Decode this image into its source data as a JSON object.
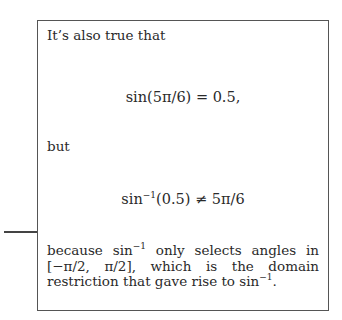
{
  "note": {
    "intro": "It’s also true that",
    "equation1": "sin(5π/6) = 0.5,",
    "connector": "but",
    "equation2": {
      "func": "sin",
      "sup": "−1",
      "rest": "(0.5) ≠ 5π/6"
    },
    "explanation": {
      "part1": "because sin",
      "sup1": "−1",
      "part2": " only selects angles in [−π/2, π/2], which is the domain restriction that gave rise to sin",
      "sup2": "−1",
      "part3": "."
    }
  }
}
